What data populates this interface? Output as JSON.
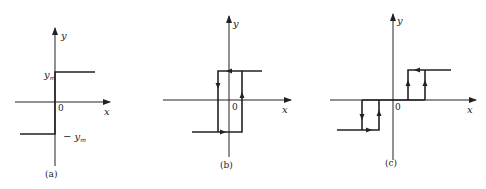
{
  "figure": {
    "panels": [
      {
        "id": "a",
        "caption": "(a)",
        "x_label": "x",
        "y_label": "y",
        "origin_label": "0",
        "ym_label": "y",
        "ym_sub": "m",
        "neg_ym_label": "− y",
        "neg_ym_sub": "m",
        "description": "ideal relay characteristic"
      },
      {
        "id": "b",
        "caption": "(b)",
        "x_label": "x",
        "y_label": "y",
        "origin_label": "0",
        "description": "relay with hysteresis"
      },
      {
        "id": "c",
        "caption": "(c)",
        "x_label": "x",
        "y_label": "y",
        "origin_label": "0",
        "description": "relay with dead zone and hysteresis"
      }
    ],
    "colors": {
      "line": "#222222",
      "background": "#ffffff"
    }
  }
}
